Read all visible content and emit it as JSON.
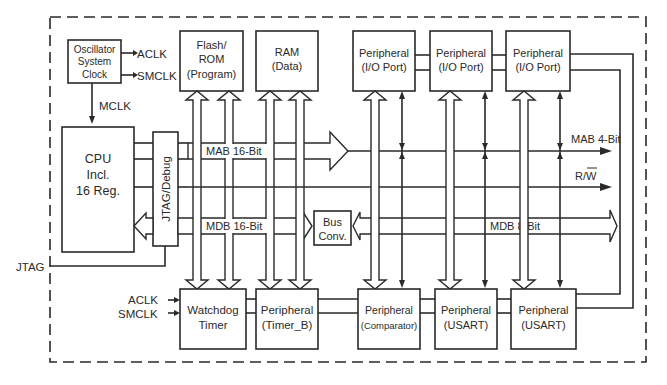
{
  "diagram": {
    "blocks": {
      "oscillator": [
        "Oscillator",
        "System",
        "Clock"
      ],
      "flash": [
        "Flash/",
        "ROM",
        "(Program)"
      ],
      "ram": [
        "RAM",
        "(Data)"
      ],
      "io1": [
        "Peripheral",
        "(I/O Port)"
      ],
      "io2": [
        "Peripheral",
        "(I/O Port)"
      ],
      "io3": [
        "Peripheral",
        "(I/O Port)"
      ],
      "cpu": [
        "CPU",
        "Incl.",
        "16 Reg."
      ],
      "jtag_debug": "JTAG/Debug",
      "bus_conv": [
        "Bus",
        "Conv."
      ],
      "watchdog": [
        "Watchdog",
        "Timer"
      ],
      "timer_b": [
        "Peripheral",
        "(Timer_B)"
      ],
      "comparator": [
        "Peripheral",
        "(Comparator)"
      ],
      "usart1": [
        "Peripheral",
        "(USART)"
      ],
      "usart2": [
        "Peripheral",
        "(USART)"
      ]
    },
    "signals": {
      "aclk": "ACLK",
      "smclk": "SMCLK",
      "mclk": "MCLK",
      "jtag": "JTAG",
      "aclk_wd": "ACLK",
      "smclk_wd": "SMCLK"
    },
    "buses": {
      "mab16": "MAB 16-Bit",
      "mdb16": "MDB 16-Bit",
      "mab4": "MAB 4-Bit",
      "rw": "R/W",
      "mdb8": "MDB 8-Bit"
    },
    "colors": {
      "line": "#2a2a2a",
      "background": "#ffffff"
    }
  }
}
